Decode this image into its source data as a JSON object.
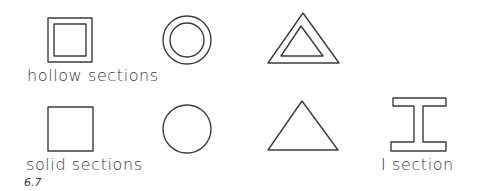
{
  "diagram": {
    "background": "#ffffff",
    "line_color": "#3c3c3c",
    "rows": [
      {
        "label": "hollow sections",
        "shapes": [
          "hollow-square",
          "hollow-circle",
          "hollow-triangle"
        ]
      },
      {
        "label": "solid sections",
        "shapes": [
          "solid-square",
          "solid-circle",
          "solid-triangle"
        ]
      }
    ],
    "extra": {
      "label": "I section",
      "shape": "i-beam"
    },
    "figure_number": "6.7"
  }
}
